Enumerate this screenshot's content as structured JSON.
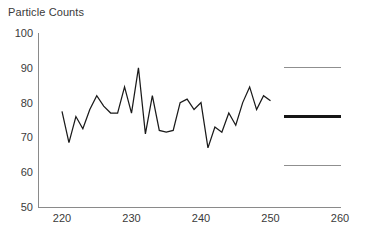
{
  "chart_data": {
    "type": "line",
    "title": "Particle Counts",
    "xlabel": "",
    "ylabel": "",
    "xlim": [
      220,
      260
    ],
    "ylim": [
      50,
      100
    ],
    "grid": false,
    "legend": "none",
    "x_ticks": [
      220,
      230,
      240,
      250,
      260
    ],
    "y_ticks": [
      50,
      60,
      70,
      80,
      90,
      100
    ],
    "x": [
      220,
      221,
      222,
      223,
      224,
      225,
      226,
      227,
      228,
      229,
      230,
      231,
      232,
      233,
      234,
      235,
      236,
      237,
      238,
      239,
      240,
      241,
      242,
      243,
      244,
      245,
      246,
      247,
      248,
      249,
      250
    ],
    "values": [
      77.5,
      68.5,
      76,
      72.5,
      78,
      82,
      79,
      77,
      77,
      84.5,
      77,
      90,
      71,
      82,
      72,
      71.5,
      72,
      80,
      81,
      78,
      80,
      67,
      73,
      71.5,
      77,
      73.5,
      80,
      84.5,
      78,
      82,
      80.5
    ],
    "series": [
      {
        "name": "Particle Counts",
        "values": [
          77.5,
          68.5,
          76,
          72.5,
          78,
          82,
          79,
          77,
          77,
          84.5,
          77,
          90,
          71,
          82,
          72,
          71.5,
          72,
          80,
          81,
          78,
          80,
          67,
          73,
          71.5,
          77,
          73.5,
          80,
          84.5,
          78,
          82,
          80.5
        ],
        "color": "#1a1a1a"
      }
    ],
    "reference_lines": [
      {
        "name": "upper-control-limit",
        "value": 90,
        "x_start": 250,
        "x_end": 260,
        "color": "#8f8f8f",
        "weight": "thin"
      },
      {
        "name": "center-line",
        "value": 76,
        "x_start": 250,
        "x_end": 260,
        "color": "#151515",
        "weight": "thick"
      },
      {
        "name": "lower-control-limit",
        "value": 62,
        "x_start": 250,
        "x_end": 260,
        "color": "#8f8f8f",
        "weight": "thin"
      }
    ]
  },
  "colors": {
    "background": "#ffffff",
    "axis": "#8a8a8a",
    "text": "#3a3a3a",
    "series": "#1a1a1a",
    "limit": "#8f8f8f"
  }
}
